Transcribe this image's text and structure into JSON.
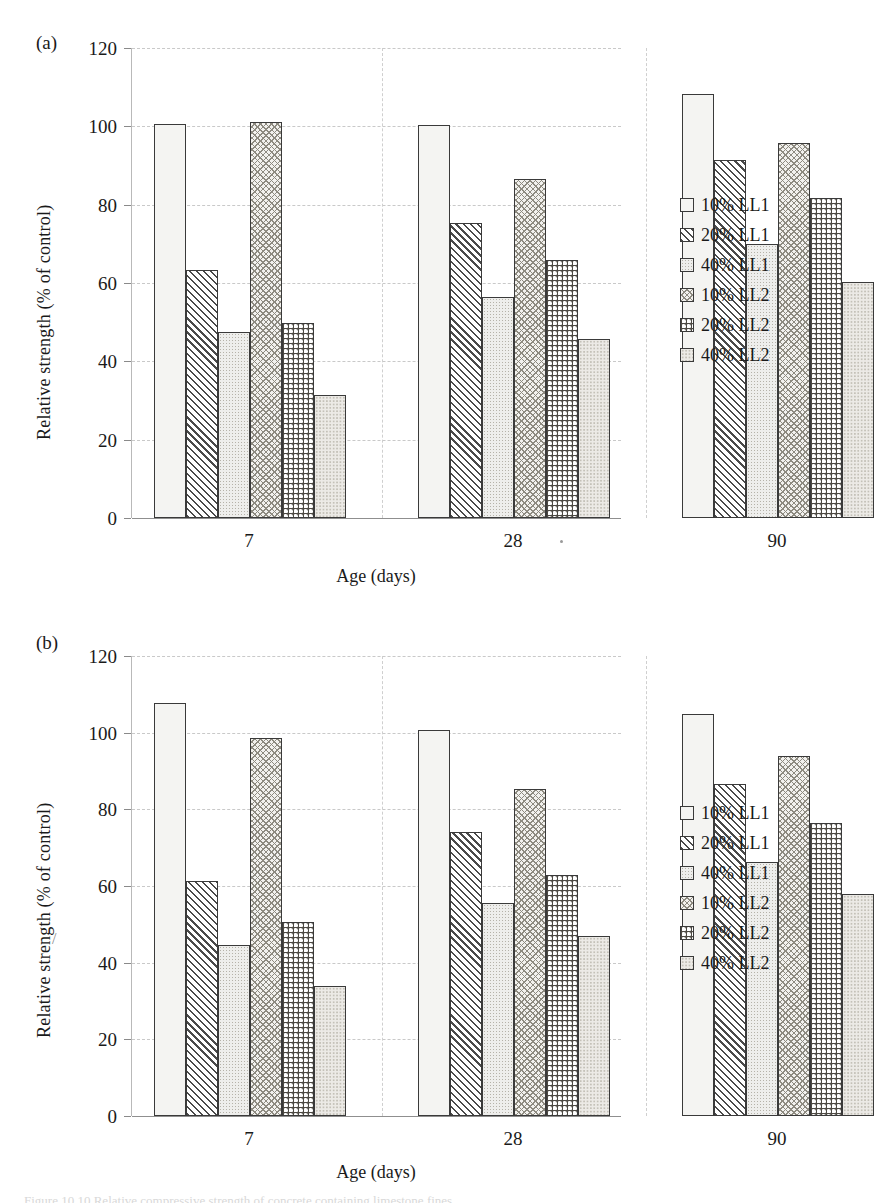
{
  "figure": {
    "panels": [
      {
        "letter": "(a)"
      },
      {
        "letter": "(b)"
      }
    ],
    "caption_sliver": "Figure 10.10  Relative compressive strength of concrete containing limestone fines."
  },
  "axes": {
    "ylabel": "Relative strength (% of control)",
    "xlabel": "Age (days)",
    "yticks": [
      "0",
      "20",
      "40",
      "60",
      "80",
      "100",
      "120"
    ],
    "xticks": [
      "7",
      "28",
      "90"
    ]
  },
  "legend": {
    "items": [
      {
        "label": "10% LL1",
        "pattern": "p1"
      },
      {
        "label": "20% LL1",
        "pattern": "p2"
      },
      {
        "label": "40% LL1",
        "pattern": "p3"
      },
      {
        "label": "10% LL2",
        "pattern": "p4"
      },
      {
        "label": "20% LL2",
        "pattern": "p5"
      },
      {
        "label": "40% LL2",
        "pattern": "p6"
      }
    ]
  },
  "chart_data": [
    {
      "type": "bar",
      "panel": "(a)",
      "title": "",
      "xlabel": "Age (days)",
      "ylabel": "Relative strength (% of control)",
      "categories": [
        "7",
        "28",
        "90"
      ],
      "ylim": [
        0,
        120
      ],
      "ytick_step": 20,
      "grid": true,
      "legend_position": "right",
      "series": [
        {
          "name": "10% LL1",
          "values": [
            100.5,
            100.3,
            108.2
          ]
        },
        {
          "name": "20% LL1",
          "values": [
            63.4,
            75.2,
            91.5
          ]
        },
        {
          "name": "40% LL1",
          "values": [
            47.6,
            56.4,
            70.0
          ]
        },
        {
          "name": "10% LL2",
          "values": [
            101.0,
            86.5,
            95.8
          ]
        },
        {
          "name": "20% LL2",
          "values": [
            49.8,
            66.0,
            81.7
          ]
        },
        {
          "name": "40% LL2",
          "values": [
            31.3,
            45.8,
            60.2
          ]
        }
      ]
    },
    {
      "type": "bar",
      "panel": "(b)",
      "title": "",
      "xlabel": "Age (days)",
      "ylabel": "Relative strength (% of control)",
      "categories": [
        "7",
        "28",
        "90"
      ],
      "ylim": [
        0,
        120
      ],
      "ytick_step": 20,
      "grid": true,
      "legend_position": "right",
      "series": [
        {
          "name": "10% LL1",
          "values": [
            107.8,
            100.8,
            105.0
          ]
        },
        {
          "name": "20% LL1",
          "values": [
            61.4,
            74.2,
            86.5
          ]
        },
        {
          "name": "40% LL1",
          "values": [
            44.6,
            55.6,
            66.3
          ]
        },
        {
          "name": "10% LL2",
          "values": [
            98.7,
            85.4,
            93.8
          ]
        },
        {
          "name": "20% LL2",
          "values": [
            50.6,
            63.0,
            76.4
          ]
        },
        {
          "name": "40% LL2",
          "values": [
            33.9,
            47.0,
            57.8
          ]
        }
      ]
    }
  ]
}
